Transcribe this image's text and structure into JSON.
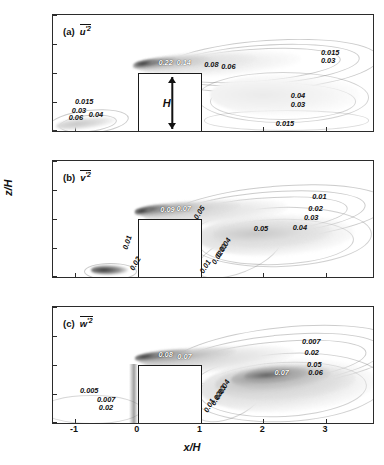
{
  "figure": {
    "axis": {
      "xlabel": "x/H",
      "ylabel": "z/H",
      "xticks": [
        "-1",
        "0",
        "1",
        "2",
        "3"
      ],
      "xtick_values": [
        -1,
        0,
        1,
        2,
        3
      ],
      "yticks": [
        "0",
        "0.5",
        "1.0",
        "1.5",
        "2.0"
      ],
      "ytick_values": [
        0,
        0.5,
        1.0,
        1.5,
        2.0
      ],
      "xlim": [
        -1.35,
        3.75
      ],
      "ylim": [
        0,
        2.0
      ]
    },
    "building": {
      "label": "H",
      "x_start": 0,
      "x_end": 1,
      "height": 1.0
    }
  },
  "panels": [
    {
      "tag": "(a)",
      "symbol": "u",
      "prime": "′2",
      "quantity": "u'2",
      "labels": [
        {
          "text": "0.22",
          "x": 0.33,
          "y": 1.17,
          "light": true,
          "rot": 0
        },
        {
          "text": "0.14",
          "x": 0.62,
          "y": 1.18,
          "light": true,
          "rot": 0
        },
        {
          "text": "0.08",
          "x": 1.06,
          "y": 1.13,
          "light": false,
          "rot": 0
        },
        {
          "text": "0.06",
          "x": 1.33,
          "y": 1.1,
          "light": false,
          "rot": 0
        },
        {
          "text": "0.015",
          "x": 2.92,
          "y": 1.35,
          "light": false,
          "rot": 0
        },
        {
          "text": "0.03",
          "x": 2.92,
          "y": 1.2,
          "light": false,
          "rot": 0
        },
        {
          "text": "0.04",
          "x": 2.44,
          "y": 0.6,
          "light": false,
          "rot": 0
        },
        {
          "text": "0.03",
          "x": 2.44,
          "y": 0.44,
          "light": false,
          "rot": 0
        },
        {
          "text": "0.015",
          "x": 2.2,
          "y": 0.12,
          "light": false,
          "rot": 0
        },
        {
          "text": "0.015",
          "x": -1.0,
          "y": 0.5,
          "light": false,
          "rot": 0
        },
        {
          "text": "0.03",
          "x": -1.05,
          "y": 0.35,
          "light": false,
          "rot": 0
        },
        {
          "text": "0.06",
          "x": -1.1,
          "y": 0.22,
          "light": false,
          "rot": 0
        },
        {
          "text": "0.04",
          "x": -0.78,
          "y": 0.27,
          "light": false,
          "rot": 0
        }
      ]
    },
    {
      "tag": "(b)",
      "symbol": "v",
      "prime": "′2",
      "quantity": "v'2",
      "labels": [
        {
          "text": "0.09",
          "x": 0.36,
          "y": 1.16,
          "light": true,
          "rot": 0
        },
        {
          "text": "0.07",
          "x": 0.62,
          "y": 1.17,
          "light": true,
          "rot": 0
        },
        {
          "text": "0.05",
          "x": 0.86,
          "y": 1.1,
          "light": false,
          "rot": -58
        },
        {
          "text": "0.05",
          "x": 1.85,
          "y": 0.82,
          "light": false,
          "rot": 0
        },
        {
          "text": "0.04",
          "x": 2.47,
          "y": 0.84,
          "light": false,
          "rot": 0
        },
        {
          "text": "0.01",
          "x": 2.78,
          "y": 1.38,
          "light": false,
          "rot": 0
        },
        {
          "text": "0.02",
          "x": 2.72,
          "y": 1.18,
          "light": false,
          "rot": 0
        },
        {
          "text": "0.03",
          "x": 2.65,
          "y": 1.02,
          "light": false,
          "rot": 0
        },
        {
          "text": "0.04",
          "x": 1.28,
          "y": 0.56,
          "light": false,
          "rot": -58
        },
        {
          "text": "0.03",
          "x": 1.22,
          "y": 0.44,
          "light": false,
          "rot": -58
        },
        {
          "text": "0.02",
          "x": 1.15,
          "y": 0.32,
          "light": false,
          "rot": -58
        },
        {
          "text": "0.01",
          "x": 0.96,
          "y": 0.18,
          "light": false,
          "rot": -58
        },
        {
          "text": "0.01",
          "x": -0.28,
          "y": 0.58,
          "light": false,
          "rot": -72
        },
        {
          "text": "0.02",
          "x": -0.16,
          "y": 0.22,
          "light": false,
          "rot": -60
        }
      ]
    },
    {
      "tag": "(c)",
      "symbol": "w",
      "prime": "′2",
      "quantity": "w'2",
      "labels": [
        {
          "text": "0.08",
          "x": 0.33,
          "y": 1.17,
          "light": true,
          "rot": 0
        },
        {
          "text": "0.07",
          "x": 0.63,
          "y": 1.14,
          "light": true,
          "rot": 0
        },
        {
          "text": "0.007",
          "x": 2.62,
          "y": 1.4,
          "light": false,
          "rot": 0
        },
        {
          "text": "0.02",
          "x": 2.66,
          "y": 1.2,
          "light": false,
          "rot": 0
        },
        {
          "text": "0.05",
          "x": 2.7,
          "y": 1.0,
          "light": false,
          "rot": 0
        },
        {
          "text": "0.06",
          "x": 2.72,
          "y": 0.86,
          "light": false,
          "rot": 0
        },
        {
          "text": "0.07",
          "x": 2.18,
          "y": 0.86,
          "light": true,
          "rot": 0
        },
        {
          "text": "0.04",
          "x": 1.26,
          "y": 0.62,
          "light": false,
          "rot": -60
        },
        {
          "text": "0.03",
          "x": 1.2,
          "y": 0.52,
          "light": false,
          "rot": -60
        },
        {
          "text": "0.02",
          "x": 1.13,
          "y": 0.42,
          "light": false,
          "rot": -60
        },
        {
          "text": "0.01",
          "x": 1.03,
          "y": 0.3,
          "light": false,
          "rot": -60
        },
        {
          "text": "0.005",
          "x": -0.92,
          "y": 0.56,
          "light": false,
          "rot": 0
        },
        {
          "text": "0.007",
          "x": -0.65,
          "y": 0.4,
          "light": false,
          "rot": 0
        },
        {
          "text": "0.02",
          "x": -0.62,
          "y": 0.26,
          "light": false,
          "rot": 0
        }
      ]
    }
  ],
  "chart_data": {
    "type": "heatmap",
    "xlabel": "x/H",
    "ylabel": "z/H",
    "xlim": [
      -1.35,
      3.75
    ],
    "ylim": [
      0,
      2.0
    ],
    "grid": false,
    "legend": "none",
    "panels": [
      {
        "tag": "(a)",
        "quantity": "u'2",
        "contour_levels": [
          0.015,
          0.03,
          0.04,
          0.06,
          0.08,
          0.14,
          0.22
        ],
        "peak_value": 0.22,
        "peak_location": {
          "x": 0.3,
          "y": 1.18
        },
        "secondary_peak_value": 0.06,
        "secondary_peak_location": {
          "x": -0.85,
          "y": 0.15
        }
      },
      {
        "tag": "(b)",
        "quantity": "v'2",
        "contour_levels": [
          0.01,
          0.02,
          0.03,
          0.04,
          0.05,
          0.07,
          0.09
        ],
        "peak_value": 0.09,
        "peak_location": {
          "x": 0.3,
          "y": 1.17
        },
        "secondary_peak_value": 0.02,
        "secondary_peak_location": {
          "x": -0.45,
          "y": 0.12
        }
      },
      {
        "tag": "(c)",
        "quantity": "w'2",
        "contour_levels": [
          0.005,
          0.007,
          0.01,
          0.02,
          0.03,
          0.04,
          0.05,
          0.06,
          0.07,
          0.08
        ],
        "peak_value": 0.08,
        "peak_location": {
          "x": 0.3,
          "y": 1.17
        },
        "secondary_peak_value": 0.07,
        "secondary_peak_location": {
          "x": 2.3,
          "y": 0.8
        }
      }
    ]
  }
}
